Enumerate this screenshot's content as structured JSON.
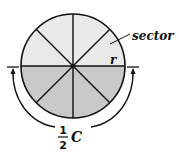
{
  "diagram": {
    "colors": {
      "upper_half": "#e9e9e9",
      "lower_half": "#c9c9c9",
      "stroke": "#111111"
    },
    "sector_count": 8,
    "labels": {
      "sector": "sector",
      "radius": "r",
      "fraction_numerator": "1",
      "fraction_denominator": "2",
      "circumference": "C"
    }
  }
}
